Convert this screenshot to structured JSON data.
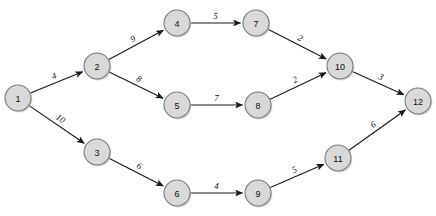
{
  "diagram": {
    "type": "directed-weighted-graph",
    "background_color": "#ffffff",
    "node_fill_color": "#d9d9d9",
    "node_stroke_color": "#7a7a7a",
    "edge_color": "#1a1a1a",
    "label_color": "#111111",
    "node_radius": 13,
    "nodes": [
      {
        "id": "1",
        "label": "1",
        "x": 18,
        "y": 98
      },
      {
        "id": "2",
        "label": "2",
        "x": 97,
        "y": 66
      },
      {
        "id": "3",
        "label": "3",
        "x": 97,
        "y": 152
      },
      {
        "id": "4",
        "label": "4",
        "x": 177,
        "y": 23
      },
      {
        "id": "5",
        "label": "5",
        "x": 177,
        "y": 105
      },
      {
        "id": "6",
        "label": "6",
        "x": 177,
        "y": 193
      },
      {
        "id": "7",
        "label": "7",
        "x": 256,
        "y": 23
      },
      {
        "id": "8",
        "label": "8",
        "x": 258,
        "y": 105
      },
      {
        "id": "9",
        "label": "9",
        "x": 258,
        "y": 193
      },
      {
        "id": "10",
        "label": "10",
        "x": 340,
        "y": 66
      },
      {
        "id": "11",
        "label": "11",
        "x": 338,
        "y": 158
      },
      {
        "id": "12",
        "label": "12",
        "x": 418,
        "y": 101
      }
    ],
    "edges": [
      {
        "from": "1",
        "to": "2",
        "weight": "4",
        "label_offset": -7
      },
      {
        "from": "1",
        "to": "3",
        "weight": "10",
        "label_offset": -7
      },
      {
        "from": "2",
        "to": "4",
        "weight": "9",
        "label_offset": -7
      },
      {
        "from": "2",
        "to": "5",
        "weight": "8",
        "label_offset": -7
      },
      {
        "from": "3",
        "to": "6",
        "weight": "6",
        "label_offset": -7
      },
      {
        "from": "4",
        "to": "7",
        "weight": "5",
        "label_offset": -7
      },
      {
        "from": "5",
        "to": "8",
        "weight": "7",
        "label_offset": -7
      },
      {
        "from": "6",
        "to": "9",
        "weight": "4",
        "label_offset": -7
      },
      {
        "from": "7",
        "to": "10",
        "weight": "2",
        "label_offset": -7
      },
      {
        "from": "8",
        "to": "10",
        "weight": "2",
        "label_offset": -7
      },
      {
        "from": "9",
        "to": "11",
        "weight": "5",
        "label_offset": -7
      },
      {
        "from": "10",
        "to": "12",
        "weight": "3",
        "label_offset": -7
      },
      {
        "from": "11",
        "to": "12",
        "weight": "6",
        "label_offset": -7
      }
    ]
  }
}
